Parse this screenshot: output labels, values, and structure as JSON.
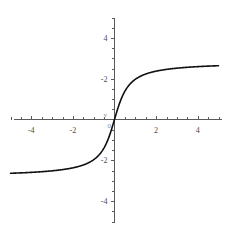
{
  "figure": {
    "title": "",
    "background_color": "#ffffff",
    "width": 230,
    "height": 238
  },
  "labels": {
    "x_axis_name": "x",
    "y_axis_name": "y",
    "origin": "0"
  },
  "chart_data": {
    "type": "line",
    "title": "",
    "subtitle": "",
    "xlabel": "x",
    "ylabel": "y",
    "xlim": [
      -5,
      5
    ],
    "ylim": [
      -5,
      5
    ],
    "grid": false,
    "legend": null,
    "legend_position": "none",
    "x_ticks_major": [
      -4,
      -2,
      2,
      4
    ],
    "x_tick_labels": [
      "-4",
      "-2",
      "2",
      "4"
    ],
    "y_ticks_major": [
      -4,
      -2,
      2,
      4
    ],
    "y_tick_labels": [
      "-4",
      "-2",
      "-2",
      "4"
    ],
    "x_ticks_minor_step": 0.5,
    "y_ticks_minor_step": 0.5,
    "axes_through_origin": true,
    "curve_color": "#111111",
    "asymptote_upper": 2.82,
    "asymptote_lower": -2.82,
    "series": [
      {
        "name": "curve",
        "x": [
          -5.0,
          -4.75,
          -4.5,
          -4.25,
          -4.0,
          -3.75,
          -3.5,
          -3.25,
          -3.0,
          -2.75,
          -2.5,
          -2.25,
          -2.0,
          -1.75,
          -1.5,
          -1.25,
          -1.0,
          -0.75,
          -0.5,
          -0.25,
          0.0,
          0.25,
          0.5,
          0.75,
          1.0,
          1.25,
          1.5,
          1.75,
          2.0,
          2.25,
          2.5,
          2.75,
          3.0,
          3.25,
          3.5,
          3.75,
          4.0,
          4.25,
          4.5,
          4.75,
          5.0
        ],
        "y": [
          -2.75,
          -2.73,
          -2.71,
          -2.69,
          -2.66,
          -2.63,
          -2.6,
          -2.56,
          -2.52,
          -2.47,
          -2.41,
          -2.35,
          -2.27,
          -2.19,
          -2.09,
          -1.97,
          -1.83,
          -1.66,
          -1.45,
          -1.18,
          0.0,
          1.18,
          1.45,
          1.66,
          1.83,
          1.97,
          2.09,
          2.19,
          2.27,
          2.35,
          2.41,
          2.47,
          2.52,
          2.56,
          2.6,
          2.63,
          2.66,
          2.69,
          2.71,
          2.73,
          2.75
        ]
      }
    ]
  }
}
